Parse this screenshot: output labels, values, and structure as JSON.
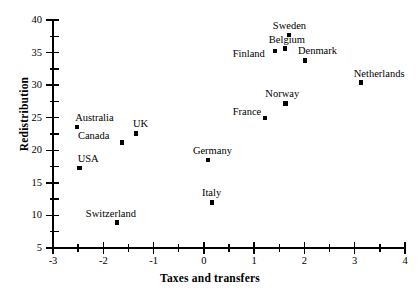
{
  "chart_data": {
    "type": "scatter",
    "title": "",
    "xlabel": "Taxes and transfers",
    "ylabel": "Redistribution",
    "xlim": [
      -3,
      4
    ],
    "ylim": [
      5,
      40
    ],
    "grid": false,
    "legend": "none",
    "x_ticks": [
      -3,
      -2,
      -1,
      0,
      1,
      2,
      3,
      4
    ],
    "x_tick_labels": [
      "-3",
      "-2",
      "-1",
      "0",
      "1",
      "2",
      "3",
      "4"
    ],
    "x_minor_ticks": [
      -2.5,
      -1.5,
      -0.5,
      0.5,
      1.5,
      2.5,
      3.5
    ],
    "y_ticks": [
      5,
      10,
      15,
      20,
      25,
      30,
      35,
      40
    ],
    "y_tick_labels": [
      "5",
      "10",
      "15",
      "20",
      "25",
      "30",
      "35",
      "40"
    ],
    "y_minor_ticks": [
      7.5,
      12.5,
      17.5,
      22.5,
      27.5,
      32.5,
      37.5
    ],
    "points": [
      {
        "label": "Australia",
        "x": -2.52,
        "y": 23.6,
        "label_dx": -2,
        "label_dy": -14
      },
      {
        "label": "USA",
        "x": -2.47,
        "y": 17.3,
        "label_dx": -2,
        "label_dy": -14
      },
      {
        "label": "Canada",
        "x": -1.63,
        "y": 21.2,
        "label_dx": -44,
        "label_dy": -11
      },
      {
        "label": "UK",
        "x": -1.35,
        "y": 22.6,
        "label_dx": -3,
        "label_dy": -14
      },
      {
        "label": "Switzerland",
        "x": -1.73,
        "y": 8.9,
        "label_dx": -31,
        "label_dy": -14
      },
      {
        "label": "Germany",
        "x": 0.08,
        "y": 18.5,
        "label_dx": -15,
        "label_dy": -14
      },
      {
        "label": "Italy",
        "x": 0.16,
        "y": 12.0,
        "label_dx": -10,
        "label_dy": -14
      },
      {
        "label": "France",
        "x": 1.21,
        "y": 25.0,
        "label_dx": -32,
        "label_dy": -11
      },
      {
        "label": "Norway",
        "x": 1.62,
        "y": 27.2,
        "label_dx": -20,
        "label_dy": -14
      },
      {
        "label": "Finland",
        "x": 1.41,
        "y": 35.2,
        "label_dx": -42,
        "label_dy": -2
      },
      {
        "label": "Belgium",
        "x": 1.61,
        "y": 35.6,
        "label_dx": -16,
        "label_dy": -14
      },
      {
        "label": "Sweden",
        "x": 1.69,
        "y": 37.7,
        "label_dx": -16,
        "label_dy": -14
      },
      {
        "label": "Denmark",
        "x": 2.01,
        "y": 33.8,
        "label_dx": -7,
        "label_dy": -14
      },
      {
        "label": "Netherlands",
        "x": 3.12,
        "y": 30.4,
        "label_dx": -7,
        "label_dy": -14
      }
    ]
  },
  "colors": {
    "axis": "#000000",
    "marker": "#000000",
    "background": "#ffffff",
    "text": "#000000"
  }
}
